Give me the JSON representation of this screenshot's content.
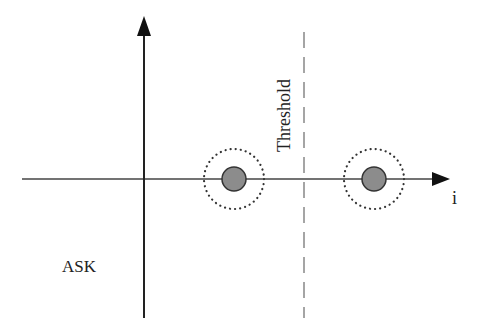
{
  "diagram": {
    "title": "ASK",
    "axis_label_x": "i",
    "threshold_label": "Threshold",
    "colors": {
      "axis": "#222222",
      "symbol_fill": "#8c8c8c",
      "symbol_stroke": "#333333",
      "noise_ring": "#333333",
      "threshold_line": "#888888"
    },
    "symbols": [
      {
        "name": "symbol-0",
        "cx": 234,
        "cy": 179
      },
      {
        "name": "symbol-1",
        "cx": 374,
        "cy": 179
      }
    ]
  }
}
